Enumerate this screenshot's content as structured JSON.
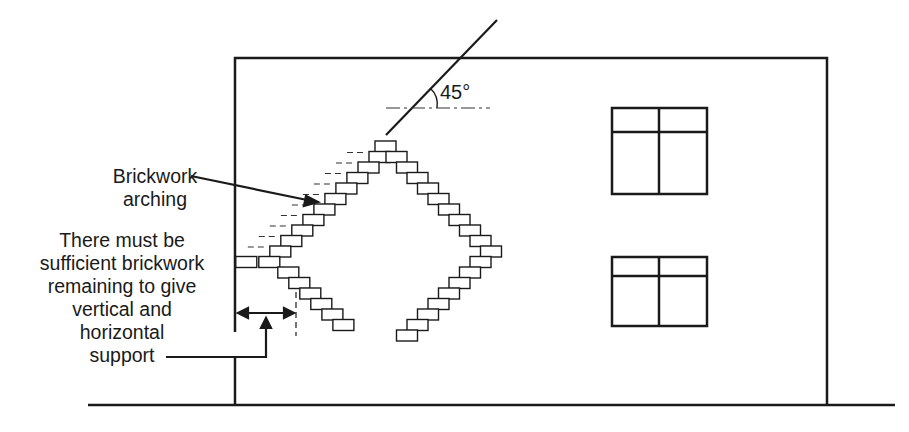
{
  "diagram": {
    "type": "building elevation showing brickwork arching over an opening",
    "labels": {
      "brickwork_arching": [
        "Brickwork",
        "arching"
      ],
      "support_note": [
        "There must be",
        "sufficient brickwork",
        "remaining to give",
        "vertical and",
        "horizontal",
        "support"
      ],
      "angle": "45°"
    },
    "elements": {
      "wall": {
        "left": 235,
        "top": 58,
        "right": 827,
        "ground_y": 405
      },
      "ground_line": {
        "x1": 88,
        "x2": 895,
        "y": 405
      },
      "windows": [
        {
          "x": 612,
          "y": 108,
          "w": 95,
          "h": 86,
          "transom_y": 132,
          "mullion_x": 659
        },
        {
          "x": 612,
          "y": 257,
          "w": 95,
          "h": 69,
          "transom_y": 276,
          "mullion_x": 659
        }
      ],
      "angle_line": {
        "x1": 386,
        "y1": 135,
        "x2": 497,
        "y2": 20
      },
      "reference_line": {
        "x1": 386,
        "x2": 490,
        "y": 108
      },
      "brick": {
        "w": 21,
        "h": 11
      }
    },
    "colors": {
      "ink": "#1a1a1a",
      "background": "#ffffff"
    }
  }
}
